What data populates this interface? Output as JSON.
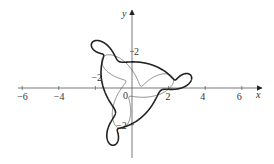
{
  "chart_data": {
    "type": "line",
    "title": "",
    "xlabel": "x",
    "ylabel": "y",
    "xlim": [
      -6.5,
      7
    ],
    "ylim": [
      -3.8,
      4.2
    ],
    "grid": false,
    "legend": null,
    "x_ticks": [
      -6,
      -4,
      -2,
      0,
      2,
      4,
      6
    ],
    "x_tick_labels": [
      "−6",
      "−4",
      "−2",
      "0",
      "2",
      "4",
      "6"
    ],
    "y_ticks": [
      2,
      -2
    ],
    "y_tick_labels": [
      "2",
      "−2"
    ],
    "series": [
      {
        "name": "thick-curve",
        "description": "parametric curve with three large lobes and three small loops, 3-fold rotational symmetry",
        "stroke": "#222222",
        "width": 1.6
      },
      {
        "name": "thin-curve",
        "description": "parametric curve with three small petal loops near lobes, 3-fold rotational symmetry",
        "stroke": "#555555",
        "width": 0.7
      }
    ]
  },
  "axes": {
    "x_label": "x",
    "y_label": "y",
    "origin_label": "0"
  }
}
